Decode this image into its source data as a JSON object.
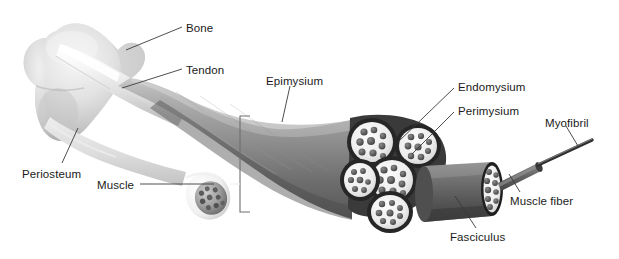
{
  "diagram": {
    "type": "anatomical-illustration",
    "style": "grayscale airbrush medical illustration on white background",
    "palette": {
      "background": "#ffffff",
      "label_text": "#1a1a1a",
      "leader_line": "#3a3a3a",
      "bone_light": "#e8e8e8",
      "bone_mid": "#c9c9c9",
      "bone_shadow": "#a8a8a8",
      "tendon_light": "#f4f4f4",
      "tendon_mid": "#d8d8d8",
      "muscle_light": "#b4b4b4",
      "muscle_mid": "#8e8e8e",
      "muscle_dark": "#5e5e5e",
      "fascicle_sheath": "#f2f2f2",
      "fascicle_outline": "#2b2b2b",
      "fiber_fill": "#6a6a6a",
      "myofibril": "#4a4a4a"
    },
    "labels": [
      {
        "id": "bone",
        "text": "Bone",
        "x": 186,
        "y": 23,
        "anchor": "left"
      },
      {
        "id": "tendon",
        "text": "Tendon",
        "x": 186,
        "y": 65,
        "anchor": "left"
      },
      {
        "id": "epimysium",
        "text": "Epimysium",
        "x": 266,
        "y": 76,
        "anchor": "left"
      },
      {
        "id": "endomysium",
        "text": "Endomysium",
        "x": 458,
        "y": 82,
        "anchor": "left"
      },
      {
        "id": "perimysium",
        "text": "Perimysium",
        "x": 458,
        "y": 106,
        "anchor": "left"
      },
      {
        "id": "myofibril",
        "text": "Myofibril",
        "x": 545,
        "y": 118,
        "anchor": "left"
      },
      {
        "id": "periosteum",
        "text": "Periosteum",
        "x": 22,
        "y": 169,
        "anchor": "left"
      },
      {
        "id": "muscle",
        "text": "Muscle",
        "x": 97,
        "y": 180,
        "anchor": "left"
      },
      {
        "id": "muscle_fiber",
        "text": "Muscle fiber",
        "x": 510,
        "y": 196,
        "anchor": "left"
      },
      {
        "id": "fasciculus",
        "text": "Fasciculus",
        "x": 450,
        "y": 232,
        "anchor": "left"
      }
    ],
    "structures": [
      {
        "id": "bone-head",
        "name": "proximal bone epiphysis",
        "note": "irregular light-gray bone head at far left"
      },
      {
        "id": "tendon-band",
        "name": "tendon",
        "note": "pale glossy band from bone head into muscle belly"
      },
      {
        "id": "muscle-belly",
        "name": "muscle belly",
        "note": "large curved gray mass sweeping right and down"
      },
      {
        "id": "epimysium-bracket",
        "name": "epimysium bracket",
        "note": "thin bracket marking the outer sheath thickness"
      },
      {
        "id": "muscle-cut",
        "name": "muscle cut face",
        "note": "small oval cut surface showing fascicle speckles"
      },
      {
        "id": "fascicle-bundle",
        "name": "fascicle bundle cut",
        "note": "five rounded fascicles each packed with fiber circles"
      },
      {
        "id": "fasciculus-tube",
        "name": "fasciculus cylinder",
        "note": "dark cylinder pulled out to the right"
      },
      {
        "id": "fiber-cut",
        "name": "muscle fiber cut face",
        "note": "small circle of myofibril dots at cylinder end"
      },
      {
        "id": "myofibril-rod",
        "name": "myofibril",
        "note": "thin dark rod extending to upper right"
      }
    ]
  }
}
